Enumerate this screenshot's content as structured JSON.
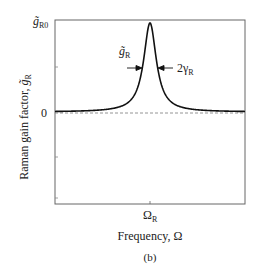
{
  "chart_data": {
    "type": "line",
    "title": "",
    "panel_label": "(b)",
    "xlabel": "Frequency, Ω",
    "ylabel": "Raman gain factor, g̃_R",
    "x_ticks": [
      {
        "label": "Ω_R",
        "value": 0
      }
    ],
    "y_ticks": [
      {
        "label": "0",
        "value": 0
      },
      {
        "label": "g̃_R0",
        "value": 1
      }
    ],
    "xlim": [
      -1,
      1
    ],
    "ylim": [
      -0.95,
      1.0
    ],
    "grid": false,
    "legend": null,
    "series": [
      {
        "name": "Raman gain spectrum (Lorentzian)",
        "style": "solid",
        "center": 0,
        "peak": 1,
        "half_width": 0.08,
        "x": [
          -1.0,
          -0.6,
          -0.4,
          -0.3,
          -0.2,
          -0.15,
          -0.1,
          -0.07,
          -0.04,
          -0.02,
          0,
          0.02,
          0.04,
          0.07,
          0.1,
          0.15,
          0.2,
          0.3,
          0.4,
          0.6,
          1.0
        ],
        "values": [
          0.01,
          0.02,
          0.04,
          0.07,
          0.14,
          0.22,
          0.39,
          0.57,
          0.8,
          0.94,
          1.0,
          0.94,
          0.8,
          0.57,
          0.39,
          0.22,
          0.14,
          0.07,
          0.04,
          0.02,
          0.01
        ]
      },
      {
        "name": "zero baseline",
        "style": "dashed",
        "x": [
          -1,
          1
        ],
        "values": [
          0,
          0
        ]
      }
    ],
    "annotations": [
      {
        "text": "g̃_R",
        "position": "left of peak, with arrow pointing right to curve"
      },
      {
        "text": "2γ_R",
        "position": "right of peak, with arrow pointing left to curve"
      }
    ]
  },
  "labels": {
    "y_top": "g̃",
    "y_top_sub": "R0",
    "y_zero": "0",
    "x_tick_main": "Ω",
    "x_tick_sub": "R",
    "xlabel": "Frequency, Ω",
    "ylabel_main": "Raman gain factor, ",
    "ylabel_sym": "g̃",
    "ylabel_sub": "R",
    "ann_left_main": "g̃",
    "ann_left_sub": "R",
    "ann_right_main": "2γ",
    "ann_right_sub": "R",
    "panel": "(b)"
  }
}
